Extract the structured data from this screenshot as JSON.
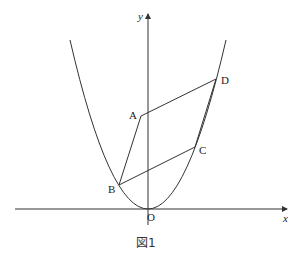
{
  "figure": {
    "caption": "図1",
    "axes": {
      "x_label": "x",
      "y_label": "y",
      "origin_label": "O"
    },
    "curve": {
      "type": "parabola",
      "description": "y = a x^2 (opens upward, vertex at O)"
    },
    "points": [
      {
        "name": "A",
        "label": "A",
        "on_curve": false,
        "on_y_axis_side": "left"
      },
      {
        "name": "B",
        "label": "B",
        "on_curve": true
      },
      {
        "name": "C",
        "label": "C",
        "on_curve": true
      },
      {
        "name": "D",
        "label": "D",
        "on_curve": true
      }
    ],
    "shape": "parallelogram ABCD",
    "segments": [
      "AB",
      "BC",
      "CD",
      "DA"
    ],
    "colors": {
      "stroke": "#333333",
      "background": "#ffffff"
    }
  }
}
